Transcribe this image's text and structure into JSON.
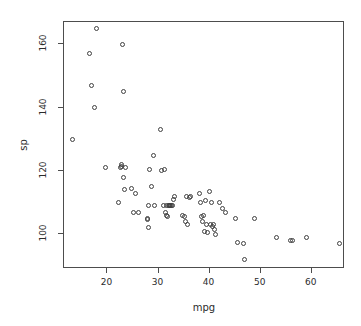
{
  "chart_data": {
    "type": "scatter",
    "title": "",
    "xlabel": "mpg",
    "ylabel": "sp",
    "xlim": [
      11.5,
      66.5
    ],
    "ylim": [
      89,
      167
    ],
    "xticks": [
      20,
      30,
      40,
      50,
      60
    ],
    "yticks": [
      100,
      120,
      140,
      160
    ],
    "grid": false,
    "legend": null,
    "point_marker": "open-circle",
    "point_color": "#404040",
    "series": [
      {
        "name": "sp vs mpg",
        "x": [
          13.2,
          16.5,
          16.9,
          17.5,
          17.8,
          19.6,
          22.2,
          22.6,
          22.7,
          22.8,
          23.0,
          23.1,
          23.2,
          23.4,
          23.6,
          24.8,
          25.2,
          25.4,
          26.0,
          27.8,
          27.9,
          28.0,
          28.1,
          28.2,
          28.6,
          29.0,
          29.2,
          30.3,
          30.5,
          31.0,
          31.2,
          31.4,
          31.5,
          31.6,
          31.8,
          32.0,
          32.1,
          32.2,
          32.4,
          32.6,
          32.8,
          33.0,
          33.2,
          34.6,
          35.0,
          35.2,
          35.4,
          35.6,
          36.0,
          36.2,
          38.0,
          38.2,
          38.4,
          38.6,
          38.8,
          39.0,
          39.2,
          39.4,
          39.6,
          40.0,
          40.2,
          40.4,
          40.6,
          40.8,
          41.0,
          41.2,
          42.0,
          42.6,
          43.2,
          45.0,
          45.4,
          46.6,
          46.9,
          48.8,
          53.0,
          55.8,
          56.2,
          58.9,
          65.4
        ],
        "y": [
          130.0,
          157.0,
          147.0,
          140.0,
          165.0,
          121.0,
          110.0,
          121.0,
          121.5,
          122.0,
          160.0,
          145.0,
          118.0,
          114.0,
          121.0,
          114.5,
          107.0,
          113.0,
          107.0,
          105.0,
          104.5,
          109.0,
          102.0,
          120.5,
          115.0,
          125.0,
          109.0,
          133.0,
          120.0,
          109.0,
          120.5,
          107.0,
          106.0,
          109.0,
          105.5,
          109.0,
          109.0,
          109.0,
          109.0,
          109.0,
          109.0,
          111.0,
          112.0,
          106.0,
          105.5,
          104.0,
          112.0,
          103.0,
          111.5,
          112.0,
          113.0,
          110.0,
          105.5,
          104.0,
          106.0,
          101.0,
          110.5,
          103.0,
          100.5,
          113.5,
          103.0,
          110.0,
          102.5,
          103.0,
          101.5,
          100.0,
          110.0,
          108.0,
          107.0,
          105.0,
          97.5,
          97.0,
          92.0,
          105.0,
          99.0,
          98.0,
          98.0,
          99.0,
          97.0
        ]
      }
    ]
  }
}
